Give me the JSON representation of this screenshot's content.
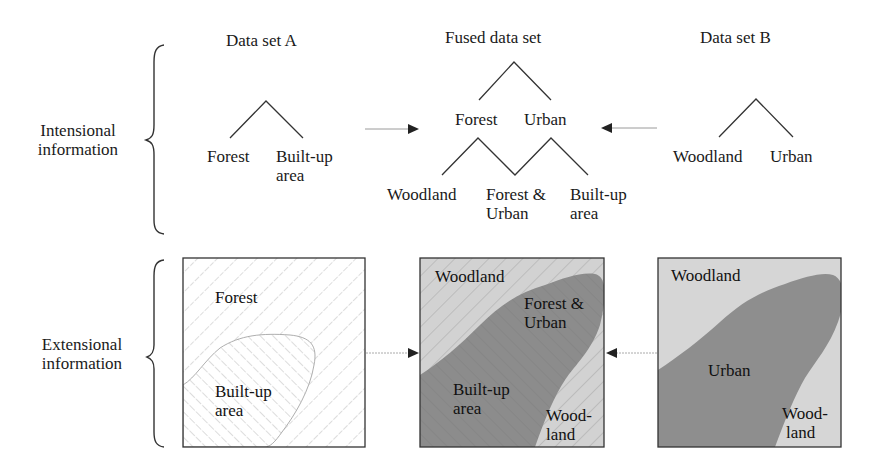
{
  "figure": {
    "row_labels": {
      "intensional": [
        "Intensional",
        "information"
      ],
      "extensional": [
        "Extensional",
        "information"
      ]
    },
    "columns": {
      "data_set_a": {
        "title": "Data set A",
        "hierarchy": {
          "children": [
            "Forest",
            "Built-up area"
          ]
        },
        "map": {
          "regions": [
            {
              "label": "Forest",
              "pattern": "hatch-descending"
            },
            {
              "label": "Built-up area",
              "pattern": "hatch-ascending"
            }
          ]
        }
      },
      "fused_data_set": {
        "title": "Fused data set",
        "hierarchy": {
          "level1": [
            "Forest",
            "Urban"
          ],
          "level2": [
            "Woodland",
            "Forest & Urban",
            "Built-up area"
          ]
        },
        "map": {
          "regions": [
            {
              "label": "Woodland",
              "fill": "light-grey-hatched"
            },
            {
              "label": "Forest & Urban",
              "fill": "dark-grey"
            },
            {
              "label": "Built-up area",
              "fill": "dark-grey"
            },
            {
              "label": "Wood-land",
              "fill": "light-grey-hatched"
            }
          ]
        }
      },
      "data_set_b": {
        "title": "Data set B",
        "hierarchy": {
          "children": [
            "Woodland",
            "Urban"
          ]
        },
        "map": {
          "regions": [
            {
              "label": "Woodland",
              "fill": "light-grey"
            },
            {
              "label": "Urban",
              "fill": "dark-grey"
            },
            {
              "label": "Wood-land",
              "fill": "light-grey"
            }
          ]
        }
      }
    },
    "text": {
      "a_title": "Data set A",
      "fused_title": "Fused data set",
      "b_title": "Data set B",
      "a_forest": "Forest",
      "a_builtup_1": "Built-up",
      "a_builtup_2": "area",
      "f_forest": "Forest",
      "f_urban": "Urban",
      "f_woodland": "Woodland",
      "f_forest_urban_1": "Forest &",
      "f_forest_urban_2": "Urban",
      "f_builtup_1": "Built-up",
      "f_builtup_2": "area",
      "b_woodland": "Woodland",
      "b_urban": "Urban",
      "map_a_forest": "Forest",
      "map_a_builtup_1": "Built-up",
      "map_a_builtup_2": "area",
      "map_f_woodland": "Woodland",
      "map_f_forest_urban_1": "Forest &",
      "map_f_forest_urban_2": "Urban",
      "map_f_builtup_1": "Built-up",
      "map_f_builtup_2": "area",
      "map_f_wood_1": "Wood-",
      "map_f_wood_2": "land",
      "map_b_woodland": "Woodland",
      "map_b_urban": "Urban",
      "map_b_wood_1": "Wood-",
      "map_b_wood_2": "land",
      "intensional_1": "Intensional",
      "intensional_2": "information",
      "extensional_1": "Extensional",
      "extensional_2": "information"
    },
    "colors": {
      "line": "#333333",
      "arrow_line": "#999999",
      "light_region": "#d4d4d4",
      "dark_region": "#8a8a8a",
      "hatch": "#9a9a9a"
    }
  }
}
